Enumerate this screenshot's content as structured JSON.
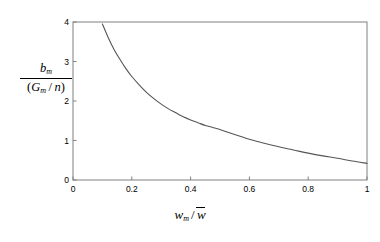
{
  "chart_data": {
    "type": "line",
    "title": "",
    "subtitle": "",
    "xlabel_parts": {
      "var": "w",
      "var_sub": "m",
      "divider": "/",
      "denominator": "w",
      "denominator_overbar": true,
      "plain": "w_m / w̄"
    },
    "ylabel_parts": {
      "numerator": "b",
      "numerator_sub": "m",
      "denominator": "(G_m / n)",
      "den_open": "(",
      "den_var": "G",
      "den_var_sub": "m",
      "den_divider": "/",
      "den_var2": "n",
      "den_close": ")",
      "plain": "b_m / (G_m / n)"
    },
    "xticks": [
      "0",
      "0.2",
      "0.4",
      "0.6",
      "0.8",
      "1"
    ],
    "xtick_values": [
      0,
      0.2,
      0.4,
      0.6,
      0.8,
      1
    ],
    "yticks": [
      "0",
      "1",
      "2",
      "3",
      "4"
    ],
    "ytick_values": [
      0,
      1,
      2,
      3,
      4
    ],
    "xlim": [
      0,
      1
    ],
    "ylim": [
      0,
      4
    ],
    "grid": false,
    "legend": null,
    "legend_position": "none",
    "series": [
      {
        "name": "curve",
        "color": "#555555",
        "x": [
          0.1,
          0.12,
          0.14,
          0.16,
          0.18,
          0.2,
          0.225,
          0.25,
          0.275,
          0.3,
          0.325,
          0.35,
          0.375,
          0.4,
          0.425,
          0.45,
          0.475,
          0.5,
          0.55,
          0.6,
          0.65,
          0.7,
          0.75,
          0.8,
          0.85,
          0.9,
          0.95,
          1.0
        ],
        "y": [
          3.95,
          3.6,
          3.3,
          3.05,
          2.82,
          2.62,
          2.41,
          2.22,
          2.06,
          1.92,
          1.8,
          1.7,
          1.6,
          1.52,
          1.45,
          1.38,
          1.33,
          1.28,
          1.15,
          1.03,
          0.93,
          0.84,
          0.76,
          0.68,
          0.61,
          0.55,
          0.48,
          0.42
        ]
      }
    ],
    "axis_color": "#808080",
    "background": "#ffffff"
  },
  "figure": {
    "width": 380,
    "height": 242,
    "plot_left": 73,
    "plot_right": 367,
    "plot_top": 22,
    "plot_bottom": 180
  }
}
